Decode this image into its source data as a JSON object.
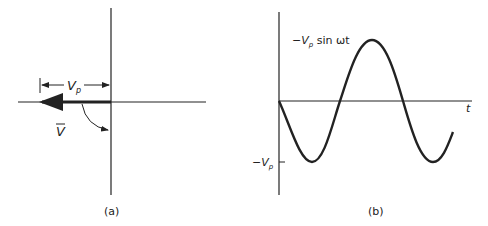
{
  "figure_a": {
    "caption": "(a)",
    "magnitude_label": "V",
    "magnitude_subscript": "p",
    "phasor_label": "V"
  },
  "figure_b": {
    "caption": "(b)",
    "curve_label_prefix": "−V",
    "curve_label_subscript": "p",
    "curve_label_suffix": " sin ωt",
    "y_tick_label_prefix": "−V",
    "y_tick_label_subscript": "p",
    "x_axis_label": "t"
  },
  "colors": {
    "ink": "#222222",
    "background": "#ffffff"
  }
}
